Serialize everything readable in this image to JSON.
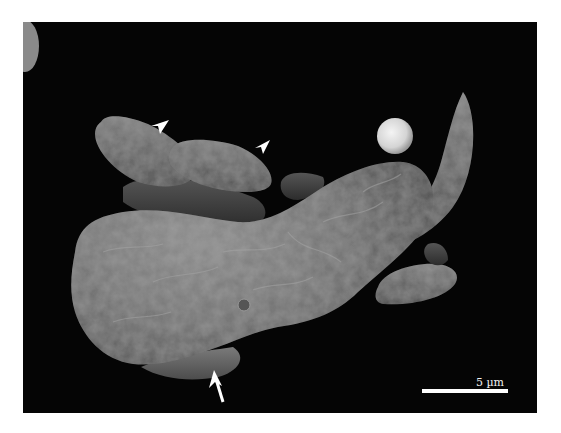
{
  "figure": {
    "type": "scanning electron micrograph",
    "colormap": "grayscale",
    "background_color": "#050505",
    "scale_bar": {
      "label": "5 µm",
      "color": "#ffffff"
    },
    "annotations": [
      {
        "kind": "arrowhead",
        "target": "crescent-shaped body upper left",
        "color": "#ffffff"
      },
      {
        "kind": "arrowhead",
        "target": "crescent-shaped body center",
        "color": "#ffffff"
      },
      {
        "kind": "arrow",
        "target": "crescent body under large cell",
        "color": "#ffffff"
      }
    ],
    "objects": [
      "large irregular cell with wrinkled surface",
      "crescent-shaped bodies",
      "small spherical particle",
      "partial round body at upper left edge"
    ]
  }
}
